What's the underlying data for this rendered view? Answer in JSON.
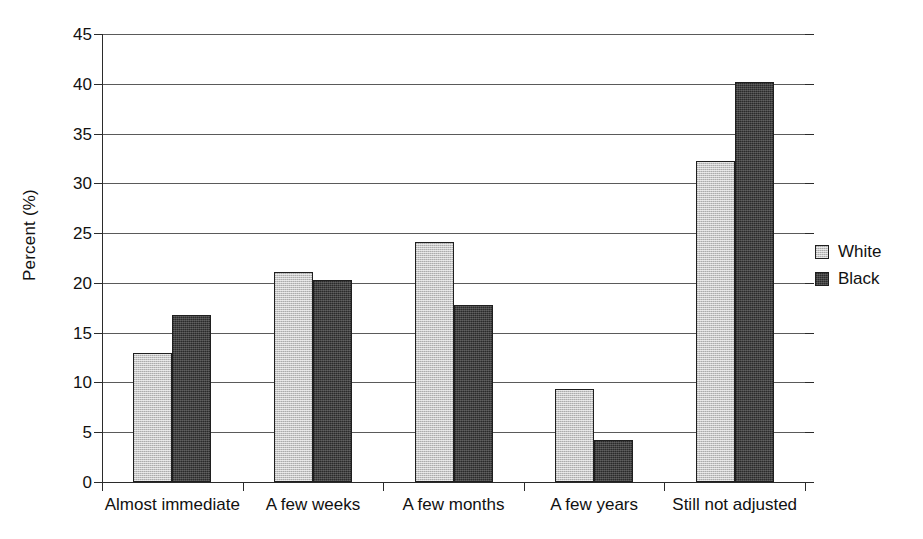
{
  "chart_data": {
    "type": "bar",
    "title": "",
    "subtitle": "",
    "xlabel": "",
    "ylabel": "Percent (%)",
    "ylim": [
      0,
      45
    ],
    "ytick_step": 5,
    "yticks": [
      0,
      5,
      10,
      15,
      20,
      25,
      30,
      35,
      40,
      45
    ],
    "ytick_labels": [
      "0",
      "5",
      "10",
      "15",
      "20",
      "25",
      "30",
      "35",
      "40",
      "45"
    ],
    "grid": true,
    "grid_axis": "y",
    "legend_position": "right",
    "categories": [
      "Almost immediate",
      "A few weeks",
      "A few months",
      "A few years",
      "Still not adjusted"
    ],
    "series": [
      {
        "name": "White",
        "color": "#c6c6c6",
        "values": [
          13.0,
          21.1,
          24.1,
          9.3,
          32.2
        ]
      },
      {
        "name": "Black",
        "color": "#414141",
        "values": [
          16.8,
          20.3,
          17.8,
          4.2,
          40.2
        ]
      }
    ]
  },
  "legend": {
    "items": [
      {
        "label": "White",
        "series_class": "white-series"
      },
      {
        "label": "Black",
        "series_class": "black-series"
      }
    ]
  }
}
